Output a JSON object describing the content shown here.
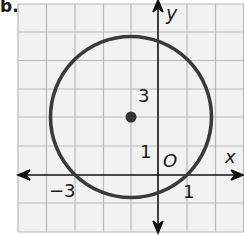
{
  "problem_label": "b.",
  "axes": {
    "x_label": "x",
    "y_label": "y",
    "origin_label": "O"
  },
  "tick_labels": {
    "x_neg3": "−3",
    "x_1": "1",
    "y_3": "3",
    "y_1": "1"
  },
  "circle": {
    "center": [
      -1,
      2
    ],
    "radius_units": 2.83,
    "stroke_color": "#3a3a3a"
  },
  "grid": {
    "line_color": "#b8b8b8",
    "background": "#f2f2f2",
    "x_range": [
      -5,
      3
    ],
    "y_range": [
      -2,
      6
    ]
  }
}
